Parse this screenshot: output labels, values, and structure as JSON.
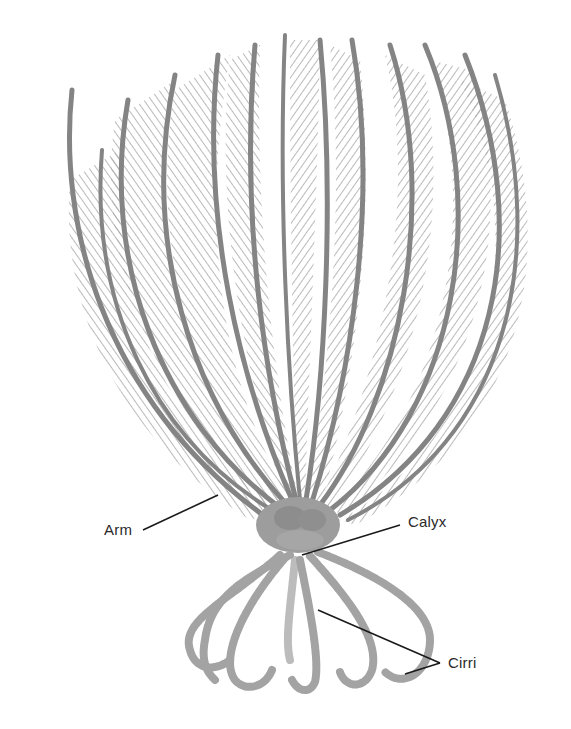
{
  "figure": {
    "background_color": "#ffffff",
    "ink_color": "#8a8a8a",
    "ink_dark_color": "#6e6e6e",
    "leader_color": "#1a1a1a"
  },
  "labels": {
    "arm": "Arm",
    "calyx": "Calyx",
    "cirri": "Cirri"
  }
}
